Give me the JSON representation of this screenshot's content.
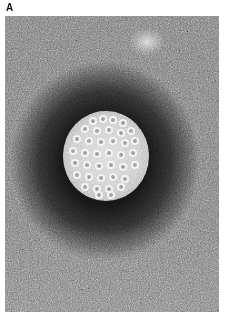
{
  "figure": {
    "panel_label": "A",
    "colors": {
      "background": "#ffffff",
      "grain_mid": "#7a7a7a",
      "stain_halo": "#0a0a0a",
      "virion": "#d0d0d0",
      "capsomer_rim": "#f2f2f2"
    },
    "capsomers": [
      [
        30,
        10
      ],
      [
        40,
        8
      ],
      [
        50,
        9
      ],
      [
        60,
        12
      ],
      [
        22,
        18
      ],
      [
        34,
        20
      ],
      [
        46,
        19
      ],
      [
        58,
        22
      ],
      [
        68,
        20
      ],
      [
        14,
        28
      ],
      [
        26,
        30
      ],
      [
        38,
        31
      ],
      [
        50,
        30
      ],
      [
        62,
        32
      ],
      [
        72,
        30
      ],
      [
        10,
        40
      ],
      [
        22,
        42
      ],
      [
        34,
        43
      ],
      [
        46,
        42
      ],
      [
        58,
        44
      ],
      [
        70,
        42
      ],
      [
        12,
        52
      ],
      [
        24,
        54
      ],
      [
        36,
        55
      ],
      [
        48,
        54
      ],
      [
        60,
        56
      ],
      [
        72,
        54
      ],
      [
        14,
        64
      ],
      [
        26,
        66
      ],
      [
        38,
        67
      ],
      [
        50,
        66
      ],
      [
        62,
        68
      ],
      [
        22,
        76
      ],
      [
        34,
        78
      ],
      [
        46,
        78
      ],
      [
        58,
        76
      ],
      [
        36,
        84
      ],
      [
        48,
        84
      ]
    ]
  }
}
